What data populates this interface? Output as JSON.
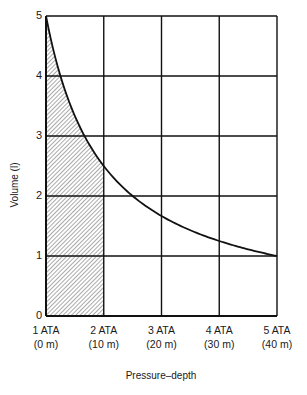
{
  "chart_data": {
    "type": "line",
    "title": "",
    "xlabel": "Pressure–depth",
    "ylabel": "Volume (l)",
    "x": [
      1,
      2,
      3,
      4,
      5
    ],
    "x_tick_labels": [
      {
        "pressure": "1 ATA",
        "depth": "(0 m)"
      },
      {
        "pressure": "2 ATA",
        "depth": "(10 m)"
      },
      {
        "pressure": "3 ATA",
        "depth": "(20 m)"
      },
      {
        "pressure": "4 ATA",
        "depth": "(30 m)"
      },
      {
        "pressure": "5 ATA",
        "depth": "(40 m)"
      }
    ],
    "y_ticks": [
      0,
      1,
      2,
      3,
      4,
      5
    ],
    "xlim": [
      1,
      5
    ],
    "ylim": [
      0,
      5
    ],
    "grid": true,
    "series": [
      {
        "name": "Volume vs pressure (Boyle's law)",
        "x": [
          1,
          1.25,
          1.5,
          2,
          2.5,
          3,
          3.5,
          4,
          4.5,
          5
        ],
        "values": [
          5,
          4,
          3.33,
          2.5,
          2,
          1.67,
          1.43,
          1.25,
          1.11,
          1
        ]
      }
    ],
    "shaded_region": {
      "x_from": 1,
      "x_to": 2,
      "under": "curve",
      "pattern": "diagonal-hatch"
    }
  },
  "axes": {
    "ylabel": "Volume (l)",
    "xlabel": "Pressure–depth",
    "y_tick_labels": [
      "0",
      "1",
      "2",
      "3",
      "4",
      "5"
    ]
  }
}
